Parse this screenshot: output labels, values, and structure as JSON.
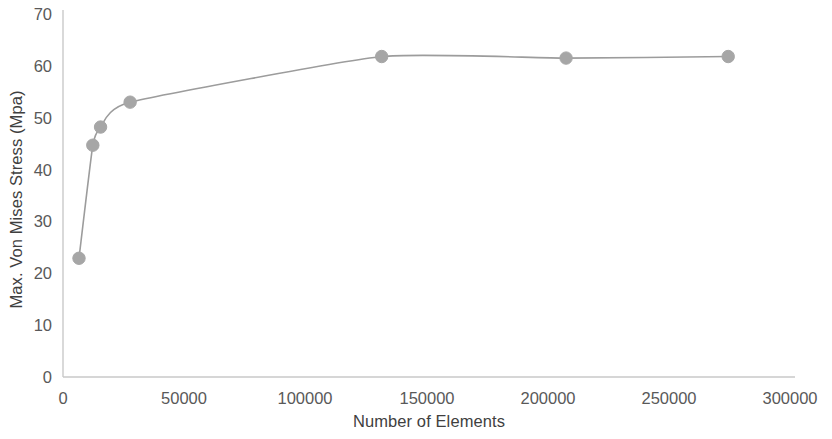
{
  "chart_data": {
    "type": "line",
    "title": "",
    "xlabel": "Number of Elements",
    "ylabel": "Max. Von Mises Stress  (Mpa)",
    "xlim": [
      0,
      300000
    ],
    "ylim": [
      0,
      70
    ],
    "xticks": [
      0,
      50000,
      100000,
      150000,
      200000,
      250000,
      300000
    ],
    "xtick_labels": [
      "0",
      "50000",
      "100000",
      "150000",
      "200000",
      "250000",
      "300000"
    ],
    "yticks": [
      0,
      10,
      20,
      30,
      40,
      50,
      60,
      70
    ],
    "ytick_labels": [
      "0",
      "10",
      "20",
      "30",
      "40",
      "50",
      "60",
      "70"
    ],
    "grid": false,
    "legend": null,
    "series": [
      {
        "name": "Max. Von Mises Stress",
        "marker": "circle",
        "color": "#a6a6a6",
        "line_color": "#9c9c9c",
        "x": [
          6600,
          12300,
          15500,
          27700,
          131500,
          207600,
          274500
        ],
        "y": [
          22.9,
          44.7,
          48.2,
          53.0,
          61.8,
          61.5,
          61.8
        ]
      }
    ],
    "annotations": []
  },
  "colors": {
    "marker": "#a6a6a6",
    "line": "#9c9c9c",
    "axis": "#c9c9c9",
    "text": "#3f3f3f",
    "tick_text": "#595959",
    "background": "#ffffff"
  }
}
